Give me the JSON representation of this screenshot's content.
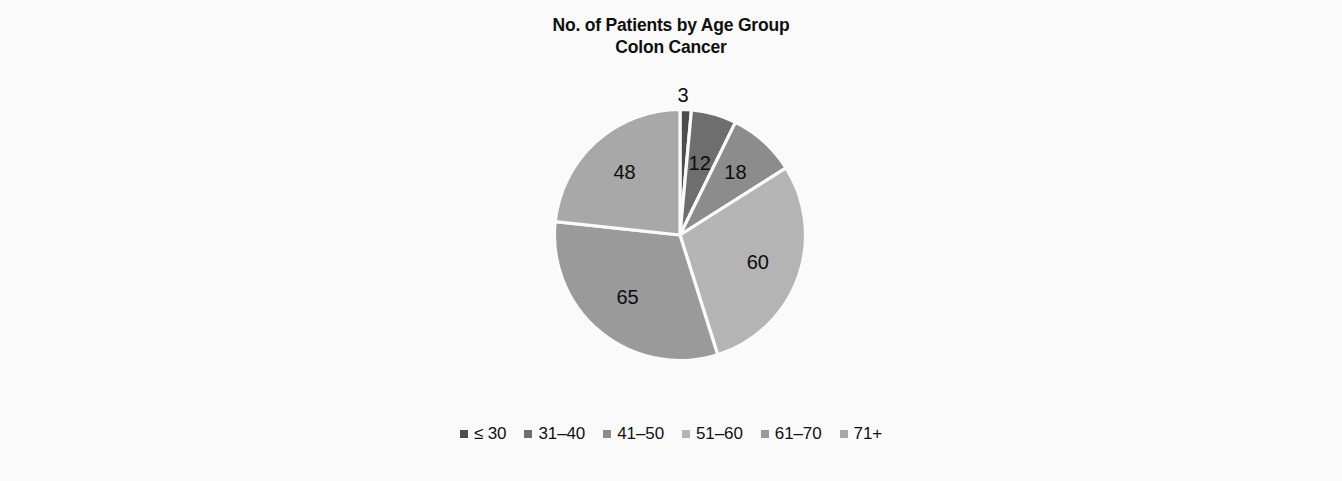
{
  "figure": {
    "background_color": "#fafafa",
    "title_lines": [
      "No. of Patients by Age Group",
      "Colon Cancer"
    ]
  },
  "chart_data": {
    "type": "pie",
    "title": "No. of Patients by Age Group\nColon Cancer",
    "title_line_1": "No. of Patients by Age Group",
    "title_line_2": "Colon Cancer",
    "xlabel": "",
    "ylabel": "",
    "value_unit": "patients",
    "total": 206,
    "start_angle_deg": 0,
    "direction": "clockwise",
    "legend_position": "bottom",
    "grid": false,
    "categories": [
      "≤ 30",
      "31–40",
      "41–50",
      "51–60",
      "61–70",
      "71+"
    ],
    "values": [
      3,
      12,
      18,
      60,
      65,
      48
    ],
    "colors": [
      "#4d4d4d",
      "#6e6e6e",
      "#8c8c8c",
      "#b4b4b4",
      "#9a9a9a",
      "#a8a8a8"
    ],
    "slices": [
      {
        "label": "≤ 30",
        "value": 3,
        "value_text": "3",
        "percent": 1.46,
        "color": "#4d4d4d",
        "label_outside": true
      },
      {
        "label": "31–40",
        "value": 12,
        "value_text": "12",
        "percent": 5.83,
        "color": "#6e6e6e",
        "label_outside": false
      },
      {
        "label": "41–50",
        "value": 18,
        "value_text": "18",
        "percent": 8.74,
        "color": "#8c8c8c",
        "label_outside": false
      },
      {
        "label": "51–60",
        "value": 60,
        "value_text": "60",
        "percent": 29.13,
        "color": "#b4b4b4",
        "label_outside": false
      },
      {
        "label": "61–70",
        "value": 65,
        "value_text": "65",
        "percent": 31.55,
        "color": "#9a9a9a",
        "label_outside": false
      },
      {
        "label": "71+",
        "value": 48,
        "value_text": "48",
        "percent": 23.3,
        "color": "#a8a8a8",
        "label_outside": false
      }
    ]
  },
  "legend": {
    "items": [
      {
        "label": "≤ 30",
        "color": "#4d4d4d"
      },
      {
        "label": "31–40",
        "color": "#6e6e6e"
      },
      {
        "label": "41–50",
        "color": "#8c8c8c"
      },
      {
        "label": "51–60",
        "color": "#b4b4b4"
      },
      {
        "label": "61–70",
        "color": "#9a9a9a"
      },
      {
        "label": "71+",
        "color": "#a8a8a8"
      }
    ]
  }
}
